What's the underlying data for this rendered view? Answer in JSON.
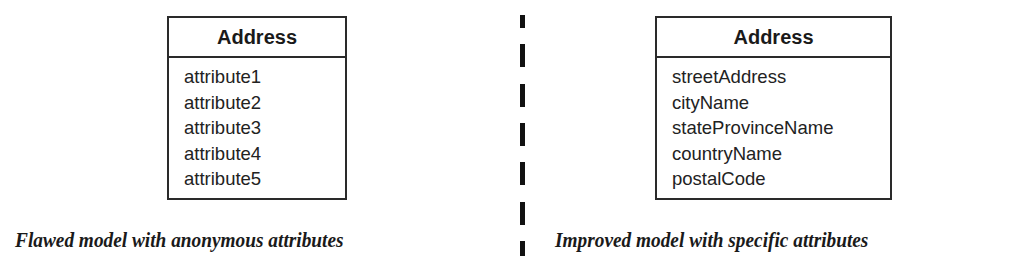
{
  "left_model": {
    "class_name": "Address",
    "attributes": [
      "attribute1",
      "attribute2",
      "attribute3",
      "attribute4",
      "attribute5"
    ],
    "caption": "Flawed model with anonymous attributes"
  },
  "right_model": {
    "class_name": "Address",
    "attributes": [
      "streetAddress",
      "cityName",
      "stateProvinceName",
      "countryName",
      "postalCode"
    ],
    "caption": "Improved model with specific attributes"
  },
  "divider": {
    "style": "dashed",
    "color": "#111111"
  }
}
